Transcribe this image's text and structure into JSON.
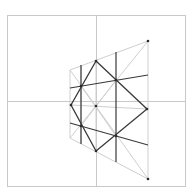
{
  "diagram": {
    "colors": {
      "background": "#ffffff",
      "frame": "#c8c8c8",
      "axis": "#c8c8c8",
      "light_construction": "#cfcfcf",
      "dark_lines": "#3a3a3a",
      "points": "#2a2a2a"
    },
    "frame": {
      "x1": 7,
      "y1": 15,
      "x2": 185,
      "y2": 186
    },
    "axes": {
      "horizontal": {
        "x1": 7,
        "y1": 101,
        "x2": 185,
        "y2": 101
      },
      "vertical": {
        "x1": 96,
        "y1": 15,
        "x2": 96,
        "y2": 186
      }
    },
    "trapezoid": {
      "points": [
        [
          70,
          70
        ],
        [
          148,
          41
        ],
        [
          148,
          179
        ],
        [
          70,
          138
        ]
      ]
    },
    "light_lines": [
      {
        "x1": 70,
        "y1": 70,
        "x2": 148,
        "y2": 179
      },
      {
        "x1": 70,
        "y1": 138,
        "x2": 148,
        "y2": 41
      },
      {
        "x1": 71,
        "y1": 105,
        "x2": 147,
        "y2": 109
      },
      {
        "x1": 81,
        "y1": 65,
        "x2": 81,
        "y2": 144
      },
      {
        "x1": 96,
        "y1": 61,
        "x2": 96,
        "y2": 151
      },
      {
        "x1": 81,
        "y1": 86,
        "x2": 116,
        "y2": 136
      },
      {
        "x1": 81,
        "y1": 126,
        "x2": 116,
        "y2": 80
      }
    ],
    "dark_lines": [
      {
        "x1": 70,
        "y1": 88,
        "x2": 148,
        "y2": 75
      },
      {
        "x1": 70,
        "y1": 123,
        "x2": 148,
        "y2": 145
      },
      {
        "x1": 81,
        "y1": 65,
        "x2": 81,
        "y2": 144
      },
      {
        "x1": 116,
        "y1": 52,
        "x2": 116,
        "y2": 162
      }
    ],
    "diamond": {
      "points": [
        [
          96,
          61
        ],
        [
          147,
          109
        ],
        [
          96,
          151
        ],
        [
          71,
          105
        ]
      ]
    },
    "key_points": [
      {
        "label": "top",
        "x": 96,
        "y": 61
      },
      {
        "label": "right",
        "x": 147,
        "y": 109
      },
      {
        "label": "bottom",
        "x": 96,
        "y": 151
      },
      {
        "label": "left",
        "x": 71,
        "y": 105
      },
      {
        "label": "center",
        "x": 96,
        "y": 106
      },
      {
        "label": "upper-left",
        "x": 81,
        "y": 86
      },
      {
        "label": "upper-right",
        "x": 116,
        "y": 80
      },
      {
        "label": "lower-left",
        "x": 81,
        "y": 126
      },
      {
        "label": "lower-right",
        "x": 116,
        "y": 136
      },
      {
        "label": "trap-top-right",
        "x": 148,
        "y": 41
      },
      {
        "label": "trap-bottom-right",
        "x": 148,
        "y": 179
      }
    ]
  }
}
